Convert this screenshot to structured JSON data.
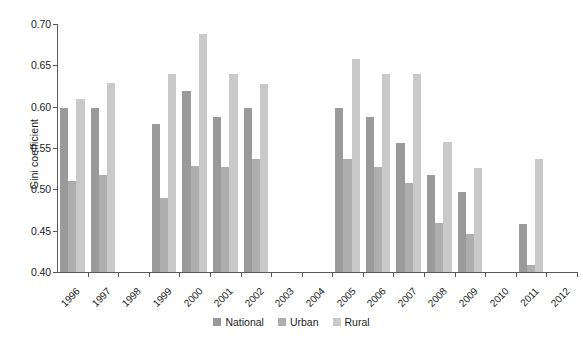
{
  "chart_data": {
    "type": "bar",
    "title": "",
    "xlabel": "",
    "ylabel": "Gini coefficient",
    "ylim": [
      0.4,
      0.7
    ],
    "ytick_labels": [
      "0.40",
      "0.45",
      "0.50",
      "0.55",
      "0.60",
      "0.65",
      "0.70"
    ],
    "ytick_values": [
      0.4,
      0.45,
      0.5,
      0.55,
      0.6,
      0.65,
      0.7
    ],
    "grid": false,
    "legend_position": "bottom-center",
    "categories": [
      "1996",
      "1997",
      "1998",
      "1999",
      "2000",
      "2001",
      "2002",
      "2003",
      "2004",
      "2005",
      "2006",
      "2007",
      "2008",
      "2009",
      "2010",
      "2011",
      "2012"
    ],
    "series": [
      {
        "name": "National",
        "color": "#9a9a9a",
        "values": [
          0.599,
          0.598,
          null,
          0.579,
          0.619,
          0.588,
          0.598,
          null,
          null,
          0.599,
          0.587,
          0.556,
          0.517,
          0.497,
          null,
          0.458,
          null
        ]
      },
      {
        "name": "Urban",
        "color": "#aeaeae",
        "values": [
          0.51,
          0.517,
          null,
          0.489,
          0.528,
          0.527,
          0.537,
          null,
          null,
          0.537,
          0.527,
          0.508,
          0.459,
          0.446,
          null,
          0.408,
          null
        ]
      },
      {
        "name": "Rural",
        "color": "#c9c9c9",
        "values": [
          0.609,
          0.629,
          null,
          0.639,
          0.688,
          0.639,
          0.628,
          null,
          null,
          0.658,
          0.639,
          0.639,
          0.557,
          0.526,
          null,
          0.537,
          null
        ]
      }
    ]
  },
  "legend": {
    "items": [
      {
        "label": "National",
        "key": "national"
      },
      {
        "label": "Urban",
        "key": "urban"
      },
      {
        "label": "Rural",
        "key": "rural"
      }
    ]
  }
}
